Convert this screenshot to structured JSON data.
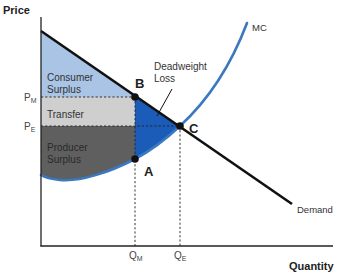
{
  "diagram": {
    "type": "monopoly welfare loss diagram",
    "axes": {
      "y_label": "Price",
      "x_label": "Quantity"
    },
    "price_ticks": [
      {
        "main": "P",
        "sub": "M"
      },
      {
        "main": "P",
        "sub": "E"
      }
    ],
    "quantity_ticks": [
      {
        "main": "Q",
        "sub": "M"
      },
      {
        "main": "Q",
        "sub": "E"
      }
    ],
    "curves": {
      "mc": "MC",
      "demand": "Demand"
    },
    "regions": {
      "consumer_surplus": [
        "Consumer",
        "Surplus"
      ],
      "transfer": "Transfer",
      "producer_surplus": [
        "Producer",
        "Surplus"
      ],
      "deadweight_loss": [
        "Deadweight",
        "Loss"
      ]
    },
    "points": {
      "a": "A",
      "b": "B",
      "c": "C"
    },
    "colors": {
      "consumer_surplus": "#a9c4e4",
      "transfer": "#cfcfcf",
      "producer_surplus": "#5f5f5f",
      "deadweight_loss": "#1a5cb8",
      "mc_curve": "#3a78c0",
      "demand_curve": "#111111",
      "axes": "#222222"
    }
  }
}
